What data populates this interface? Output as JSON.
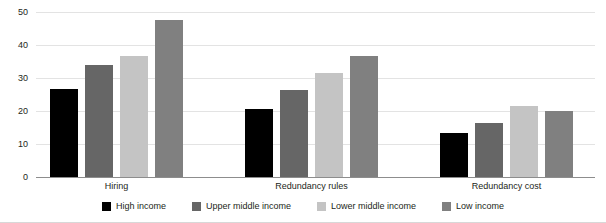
{
  "chart_data": {
    "type": "bar",
    "title": "",
    "xlabel": "",
    "ylabel": "",
    "ylim": [
      0,
      50
    ],
    "yticks": [
      0,
      10,
      20,
      30,
      40,
      50
    ],
    "grid": true,
    "legend_position": "bottom",
    "categories": [
      "Hiring",
      "Redundancy rules",
      "Redundancy cost"
    ],
    "series": [
      {
        "name": "High income",
        "color": "#000000",
        "values": [
          26.8,
          20.5,
          13.4
        ]
      },
      {
        "name": "Upper middle income",
        "color": "#666666",
        "values": [
          34.0,
          26.5,
          16.5
        ]
      },
      {
        "name": "Lower middle income",
        "color": "#c4c4c4",
        "values": [
          36.8,
          31.5,
          21.5
        ]
      },
      {
        "name": "Low income",
        "color": "#808080",
        "values": [
          47.5,
          36.8,
          19.9
        ]
      }
    ]
  }
}
